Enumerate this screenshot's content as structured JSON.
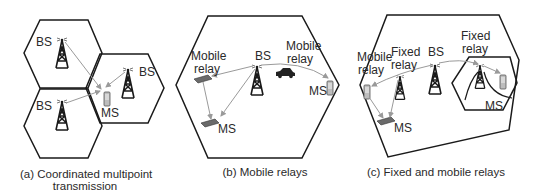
{
  "colors": {
    "outline": "#1a1a1a",
    "link": "#9a9a9a",
    "device": "#8a8a8a",
    "background": "#ffffff"
  },
  "panels": [
    {
      "id": "a",
      "caption_line1": "(a) Coordinated multipoint",
      "caption_line2": "transmission",
      "labels": {
        "bs_top": "BS",
        "bs_right": "BS",
        "bs_bottom": "BS",
        "ms": "MS"
      }
    },
    {
      "id": "b",
      "caption": "(b) Mobile relays",
      "labels": {
        "mobile_relay_left_1": "Mobile",
        "mobile_relay_left_2": "relay",
        "bs": "BS",
        "mobile_relay_right_1": "Mobile",
        "mobile_relay_right_2": "relay",
        "ms_bottom": "MS",
        "ms_right": "MS"
      }
    },
    {
      "id": "c",
      "caption": "(c) Fixed and mobile relays",
      "labels": {
        "mobile_relay_1": "Mobile",
        "mobile_relay_2": "relay",
        "fixed_relay_left_1": "Fixed",
        "fixed_relay_left_2": "relay",
        "bs": "BS",
        "fixed_relay_right_1": "Fixed",
        "fixed_relay_right_2": "relay",
        "ms_bottom": "MS",
        "ms_right": "MS"
      }
    }
  ],
  "icons": [
    "base-station-tower-icon",
    "mobile-station-phone-icon",
    "mobile-relay-car-icon",
    "mobile-relay-laptop-icon",
    "fixed-relay-tower-icon"
  ]
}
